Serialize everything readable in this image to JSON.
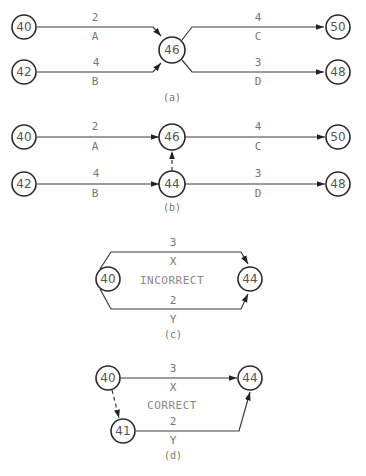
{
  "panels": {
    "a": {
      "caption": "(a)",
      "nodes": {
        "n40": "40",
        "n42": "42",
        "n46": "46",
        "n50": "50",
        "n48": "48"
      },
      "activities": [
        {
          "name": "A",
          "duration": "2",
          "from": "40",
          "to": "46"
        },
        {
          "name": "B",
          "duration": "4",
          "from": "42",
          "to": "46"
        },
        {
          "name": "C",
          "duration": "4",
          "from": "46",
          "to": "50"
        },
        {
          "name": "D",
          "duration": "3",
          "from": "46",
          "to": "48"
        }
      ]
    },
    "b": {
      "caption": "(b)",
      "nodes": {
        "n40": "40",
        "n42": "42",
        "n46": "46",
        "n44": "44",
        "n50": "50",
        "n48": "48"
      },
      "activities": [
        {
          "name": "A",
          "duration": "2",
          "from": "40",
          "to": "46"
        },
        {
          "name": "B",
          "duration": "4",
          "from": "42",
          "to": "44"
        },
        {
          "name": "C",
          "duration": "4",
          "from": "46",
          "to": "50"
        },
        {
          "name": "D",
          "duration": "3",
          "from": "44",
          "to": "48"
        }
      ],
      "dummy": {
        "from": "44",
        "to": "46"
      }
    },
    "c": {
      "caption": "(c)",
      "note": "INCORRECT",
      "nodes": {
        "n40": "40",
        "n44": "44"
      },
      "activities": [
        {
          "name": "X",
          "duration": "3",
          "from": "40",
          "to": "44"
        },
        {
          "name": "Y",
          "duration": "2",
          "from": "40",
          "to": "44"
        }
      ]
    },
    "d": {
      "caption": "(d)",
      "note": "CORRECT",
      "nodes": {
        "n40": "40",
        "n41": "41",
        "n44": "44"
      },
      "activities": [
        {
          "name": "X",
          "duration": "3",
          "from": "40",
          "to": "44"
        },
        {
          "name": "Y",
          "duration": "2",
          "from": "41",
          "to": "44"
        }
      ],
      "dummy": {
        "from": "40",
        "to": "41"
      }
    }
  }
}
